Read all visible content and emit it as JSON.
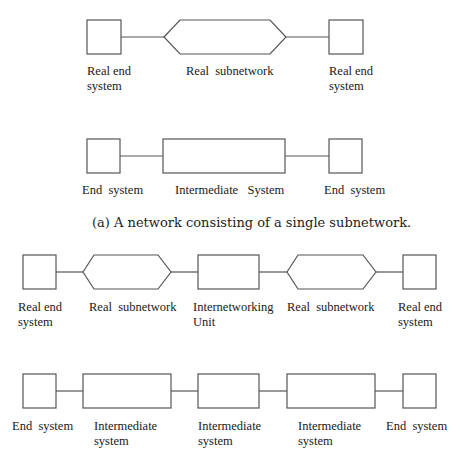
{
  "figure_a": {
    "caption": "(a) A network consisting of a single subnetwork.",
    "real_row": {
      "labels": [
        "Real end\nsystem",
        "Real  subnetwork",
        "Real end\nsystem"
      ]
    },
    "abstract_row": {
      "labels": [
        "End  system",
        "Intermediate   System",
        "End  system"
      ]
    }
  },
  "figure_b": {
    "real_row": {
      "labels": [
        "Real end\nsystem",
        "Real  subnetwork",
        "Internetworking\nUnit",
        "Real  subnetwork",
        "Real end\nsystem"
      ]
    },
    "abstract_row": {
      "labels": [
        "End  system",
        "Intermediate\nsystem",
        "Intermediate\nsystem",
        "Intermediate\nsystem",
        "End  system"
      ]
    }
  },
  "colors": {
    "stroke": "#555555",
    "text": "#1a1a1a",
    "background": "#ffffff"
  }
}
